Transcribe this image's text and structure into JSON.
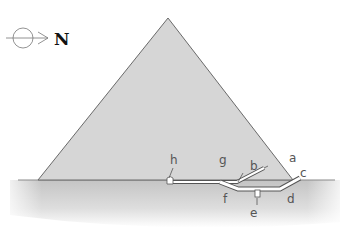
{
  "diagram": {
    "type": "pyramid-cross-section",
    "compass": {
      "icon": "north-arrow-icon",
      "label": "N"
    },
    "labels": {
      "a": "a",
      "b": "b",
      "c": "c",
      "d": "d",
      "e": "e",
      "f": "f",
      "g": "g",
      "h": "h"
    },
    "colors": {
      "pyramid_fill": "#d6d6d6",
      "pyramid_stroke": "#6a6a6a",
      "ground": "#c8c8c8",
      "passage": "#ffffff",
      "label": "#555555"
    }
  }
}
